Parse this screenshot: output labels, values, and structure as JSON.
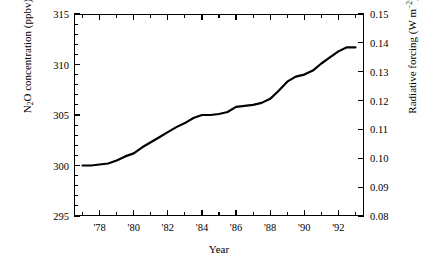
{
  "chart_data": {
    "type": "line",
    "title": "",
    "xlabel": "Year",
    "ylabel_left": "N2O concentration (ppbv)",
    "ylabel_right": "Radiative forcing (W m-2)",
    "xlim": [
      1976.5,
      1993.5
    ],
    "ylim_left": [
      295,
      315
    ],
    "ylim_right": [
      0.08,
      0.15
    ],
    "grid": false,
    "legend": null,
    "x_major_ticks": [
      1978,
      1980,
      1982,
      1984,
      1986,
      1988,
      1990,
      1992
    ],
    "x_major_tick_labels": [
      "'78",
      "'80",
      "'82",
      "'84",
      "'86",
      "'88",
      "'90",
      "'92"
    ],
    "x_minor_ticks": [
      1977,
      1979,
      1981,
      1983,
      1985,
      1987,
      1989,
      1991,
      1993
    ],
    "y_left_major_ticks": [
      295,
      300,
      305,
      310,
      315
    ],
    "y_left_major_tick_labels": [
      "295",
      "300",
      "305",
      "310",
      "315"
    ],
    "y_left_minor_ticks": [
      296,
      297,
      298,
      299,
      301,
      302,
      303,
      304,
      306,
      307,
      308,
      309,
      311,
      312,
      313,
      314
    ],
    "y_right_major_ticks": [
      0.08,
      0.09,
      0.1,
      0.11,
      0.12,
      0.13,
      0.14,
      0.15
    ],
    "y_right_major_tick_labels": [
      "0.08",
      "0.09",
      "0.10",
      "0.11",
      "0.12",
      "0.13",
      "0.14",
      "0.15"
    ],
    "series": [
      {
        "name": "N2O concentration",
        "color": "#000000",
        "line_width": 2.2,
        "x": [
          1977.0,
          1977.5,
          1978.0,
          1978.5,
          1979.0,
          1979.5,
          1980.0,
          1980.5,
          1981.0,
          1981.5,
          1982.0,
          1982.5,
          1983.0,
          1983.5,
          1984.0,
          1984.5,
          1985.0,
          1985.5,
          1986.0,
          1986.5,
          1987.0,
          1987.5,
          1988.0,
          1988.5,
          1989.0,
          1989.5,
          1990.0,
          1990.5,
          1991.0,
          1991.5,
          1992.0,
          1992.5,
          1993.0
        ],
        "y": [
          300.0,
          300.0,
          300.1,
          300.2,
          300.5,
          300.9,
          301.2,
          301.8,
          302.3,
          302.8,
          303.3,
          303.8,
          304.2,
          304.7,
          305.0,
          305.0,
          305.1,
          305.3,
          305.8,
          305.9,
          306.0,
          306.2,
          306.6,
          307.4,
          308.3,
          308.8,
          309.0,
          309.4,
          310.1,
          310.7,
          311.3,
          311.7,
          311.7
        ]
      }
    ]
  },
  "axis_labels": {
    "x_title": "Year",
    "y_left_title_pre": "N",
    "y_left_title_sub": "2",
    "y_left_title_post": "O concentration (ppbv)",
    "y_right_title_pre": "Radiative forcing (W m",
    "y_right_title_sup": "−2",
    "y_right_title_post": ")"
  }
}
